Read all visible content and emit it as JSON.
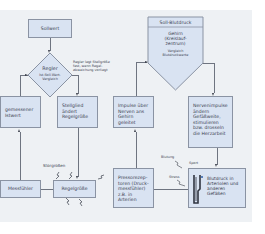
{
  "left_diagram": {
    "setpoint": "Sollwert",
    "controller": {
      "title": "Regler",
      "subtitle": "Ist-Soll-Wert-Vergleich"
    },
    "controller_note": "Regler legt Stellgröße fest, wenn Regel-abweichung vorliegt",
    "measured_value": "gemessener Istwert",
    "actuator": "Stellglied ändert Regelgröße",
    "disturbances_label": "Störgrößen",
    "sensor": "Messfühler",
    "controlled_variable": "Regelgröße"
  },
  "right_diagram": {
    "setpoint": {
      "title": "Soll-Blutdruck",
      "center": "Gehirn (Kreislauf-zentrum)",
      "compare": "Vergleich Blutdruckwerte"
    },
    "nerve_impulses_to_brain": "Impulse über Nerven ans Gehirn geleitet",
    "nerve_impulses_effect": "Nervenimpulse ändern Gefäßweite, stimulieren bzw. drosseln die Herzarbeit",
    "pressoreceptors": "Pressorezep-toren (Druck-messfühler) z.B. in Arterien",
    "blood_pressure": "Blutdruck in Arteriolen und anderen Gefäßen",
    "disturbances": [
      "Blutung",
      "Sport",
      "Stress"
    ]
  },
  "colors": {
    "panel_bg": "#eef1f4",
    "box_fill": "#d9e3f2",
    "box_border": "#8a93a3",
    "text": "#3a4150"
  }
}
